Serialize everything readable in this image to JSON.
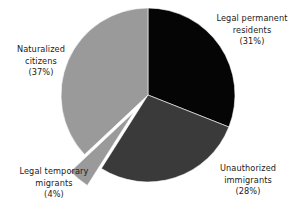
{
  "chart_data": {
    "type": "pie",
    "title": "",
    "subtitle": "",
    "xlabel": "",
    "ylabel": "",
    "legend_position": "none",
    "grid": false,
    "labels_inline": true,
    "center": {
      "x": 148,
      "y": 95
    },
    "radius": 87,
    "start_angle_deg": 0,
    "direction": "clockwise",
    "categories": [
      "Legal permanent residents",
      "Unauthorized immigrants",
      "Legal temporary migrants",
      "Naturalized citizens"
    ],
    "values": [
      31,
      28,
      4,
      37
    ],
    "value_unit": "%",
    "colors": [
      "#050505",
      "#3a3a3a",
      "#9a9a9a",
      "#9a9a9a"
    ],
    "slices": [
      {
        "name": "Legal permanent residents",
        "value": 31,
        "value_text": "(31%)",
        "color": "#050505",
        "exploded": false,
        "start_deg": 0,
        "end_deg": 111.6
      },
      {
        "name": "Unauthorized immigrants",
        "value": 28,
        "value_text": "(28%)",
        "color": "#3a3a3a",
        "exploded": false,
        "start_deg": 111.6,
        "end_deg": 212.4
      },
      {
        "name": "Legal temporary migrants",
        "value": 4,
        "value_text": "(4%)",
        "color": "#9a9a9a",
        "exploded": true,
        "explode_offset": 22,
        "start_deg": 212.4,
        "end_deg": 226.8
      },
      {
        "name": "Naturalized citizens",
        "value": 37,
        "value_text": "(37%)",
        "color": "#9a9a9a",
        "exploded": false,
        "start_deg": 226.8,
        "end_deg": 360
      }
    ]
  },
  "labels": {
    "legal_permanent_residents": {
      "line1": "Legal permanent",
      "line2": "residents",
      "line3": "(31%)"
    },
    "naturalized_citizens": {
      "line1": "Naturalized",
      "line2": "citizens",
      "line3": "(37%)"
    },
    "legal_temporary_migrants": {
      "line1": "Legal temporary",
      "line2": "migrants",
      "line3": "(4%)"
    },
    "unauthorized_immigrants": {
      "line1": "Unauthorized",
      "line2": "immigrants",
      "line3": "(28%)"
    }
  }
}
